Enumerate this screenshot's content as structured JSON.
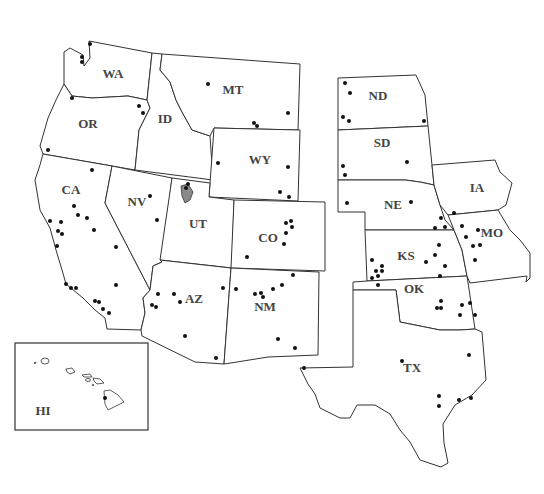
{
  "map": {
    "title": "",
    "region": "Western and Central United States",
    "colors": {
      "background": "#ffffff",
      "border": "#333333",
      "dot": "#111111",
      "label": "#444444",
      "lake": "#8a8a8a"
    },
    "states": [
      {
        "abbr": "WA",
        "label": "WA",
        "lx": 113,
        "ly": 78
      },
      {
        "abbr": "OR",
        "label": "OR",
        "lx": 88,
        "ly": 128
      },
      {
        "abbr": "ID",
        "label": "ID",
        "lx": 165,
        "ly": 123
      },
      {
        "abbr": "MT",
        "label": "MT",
        "lx": 233,
        "ly": 94
      },
      {
        "abbr": "WY",
        "label": "WY",
        "lx": 260,
        "ly": 164
      },
      {
        "abbr": "CA",
        "label": "CA",
        "lx": 71,
        "ly": 194
      },
      {
        "abbr": "NV",
        "label": "NV",
        "lx": 137,
        "ly": 206
      },
      {
        "abbr": "UT",
        "label": "UT",
        "lx": 198,
        "ly": 228
      },
      {
        "abbr": "CO",
        "label": "CO",
        "lx": 268,
        "ly": 242
      },
      {
        "abbr": "AZ",
        "label": "AZ",
        "lx": 194,
        "ly": 303
      },
      {
        "abbr": "NM",
        "label": "NM",
        "lx": 265,
        "ly": 311
      },
      {
        "abbr": "ND",
        "label": "ND",
        "lx": 378,
        "ly": 100
      },
      {
        "abbr": "SD",
        "label": "SD",
        "lx": 382,
        "ly": 147
      },
      {
        "abbr": "NE",
        "label": "NE",
        "lx": 393,
        "ly": 209
      },
      {
        "abbr": "IA",
        "label": "IA",
        "lx": 477,
        "ly": 192
      },
      {
        "abbr": "KS",
        "label": "KS",
        "lx": 406,
        "ly": 260
      },
      {
        "abbr": "MO",
        "label": "MO",
        "lx": 492,
        "ly": 237
      },
      {
        "abbr": "OK",
        "label": "OK",
        "lx": 414,
        "ly": 293
      },
      {
        "abbr": "TX",
        "label": "TX",
        "lx": 412,
        "ly": 372
      },
      {
        "abbr": "HI",
        "label": "HI",
        "lx": 43,
        "ly": 415
      }
    ],
    "points": [
      [
        90,
        44
      ],
      [
        82,
        57
      ],
      [
        82,
        62
      ],
      [
        72,
        98
      ],
      [
        139,
        106
      ],
      [
        143,
        113
      ],
      [
        48,
        150
      ],
      [
        208,
        84
      ],
      [
        254,
        123
      ],
      [
        257,
        126
      ],
      [
        288,
        113
      ],
      [
        218,
        163
      ],
      [
        288,
        167
      ],
      [
        280,
        192
      ],
      [
        289,
        197
      ],
      [
        92,
        170
      ],
      [
        74,
        206
      ],
      [
        78,
        215
      ],
      [
        61,
        222
      ],
      [
        87,
        218
      ],
      [
        50,
        221
      ],
      [
        58,
        231
      ],
      [
        62,
        234
      ],
      [
        57,
        246
      ],
      [
        116,
        247
      ],
      [
        150,
        196
      ],
      [
        157,
        220
      ],
      [
        94,
        230
      ],
      [
        116,
        285
      ],
      [
        66,
        284
      ],
      [
        71,
        288
      ],
      [
        76,
        288
      ],
      [
        95,
        301
      ],
      [
        99,
        302
      ],
      [
        103,
        309
      ],
      [
        109,
        313
      ],
      [
        186,
        188
      ],
      [
        188,
        184
      ],
      [
        286,
        223
      ],
      [
        291,
        221
      ],
      [
        292,
        227
      ],
      [
        286,
        233
      ],
      [
        284,
        244
      ],
      [
        247,
        257
      ],
      [
        158,
        294
      ],
      [
        174,
        294
      ],
      [
        180,
        302
      ],
      [
        152,
        305
      ],
      [
        156,
        307
      ],
      [
        185,
        336
      ],
      [
        216,
        358
      ],
      [
        223,
        288
      ],
      [
        236,
        289
      ],
      [
        255,
        294
      ],
      [
        261,
        293
      ],
      [
        263,
        297
      ],
      [
        273,
        289
      ],
      [
        282,
        285
      ],
      [
        293,
        275
      ],
      [
        278,
        339
      ],
      [
        295,
        348
      ],
      [
        345,
        83
      ],
      [
        350,
        93
      ],
      [
        343,
        117
      ],
      [
        349,
        121
      ],
      [
        424,
        121
      ],
      [
        343,
        166
      ],
      [
        345,
        175
      ],
      [
        407,
        162
      ],
      [
        411,
        202
      ],
      [
        347,
        203
      ],
      [
        435,
        228
      ],
      [
        441,
        218
      ],
      [
        445,
        227
      ],
      [
        454,
        213
      ],
      [
        439,
        245
      ],
      [
        478,
        230
      ],
      [
        480,
        245
      ],
      [
        475,
        260
      ],
      [
        462,
        226
      ],
      [
        466,
        237
      ],
      [
        473,
        246
      ],
      [
        372,
        260
      ],
      [
        372,
        278
      ],
      [
        376,
        271
      ],
      [
        382,
        271
      ],
      [
        378,
        276
      ],
      [
        382,
        266
      ],
      [
        378,
        285
      ],
      [
        426,
        262
      ],
      [
        435,
        255
      ],
      [
        440,
        276
      ],
      [
        445,
        266
      ],
      [
        441,
        301
      ],
      [
        441,
        308
      ],
      [
        462,
        305
      ],
      [
        460,
        315
      ],
      [
        470,
        303
      ],
      [
        475,
        315
      ],
      [
        304,
        368
      ],
      [
        402,
        361
      ],
      [
        437,
        308
      ],
      [
        469,
        355
      ],
      [
        439,
        396
      ],
      [
        439,
        406
      ],
      [
        459,
        400
      ],
      [
        471,
        398
      ],
      [
        105,
        398
      ]
    ]
  }
}
